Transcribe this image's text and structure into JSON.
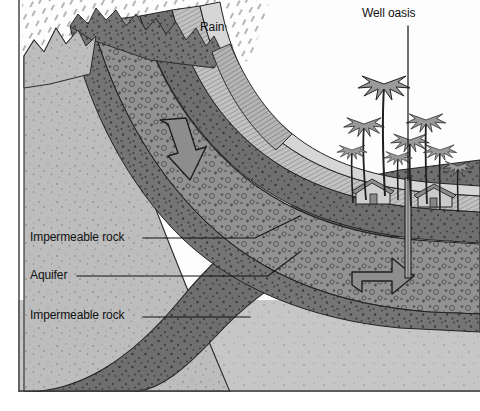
{
  "diagram": {
    "labels": {
      "rain": "Rain",
      "well_oasis": "Well oasis",
      "impermeable_rock_upper": "Impermeable rock",
      "aquifer": "Aquifer",
      "impermeable_rock_lower": "Impermeable rock"
    },
    "colors": {
      "sky": "#ffffff",
      "rain_hatch": "#7b7b7b",
      "surface_hatched": "#b9b9b9",
      "impermeable_dark": "#6e6e6e",
      "aquifer_mid": "#8e8e8e",
      "basement_light": "#bdbdbd",
      "outline": "#1a1a1a",
      "text": "#111111",
      "palm_fill": "#9a9a9a",
      "building_fill": "#c9c9c9"
    },
    "layers": [
      {
        "name": "rain",
        "pattern": "diagonal-dashes",
        "position": "top-left sky"
      },
      {
        "name": "surface-soil",
        "pattern": "fine-diagonal-hatch",
        "position": "topmost ground layer"
      },
      {
        "name": "impermeable-rock-upper",
        "pattern": "dense-dots",
        "position": "below surface"
      },
      {
        "name": "aquifer",
        "pattern": "circles-and-dots",
        "position": "middle water-bearing layer"
      },
      {
        "name": "impermeable-rock-lower",
        "pattern": "dense-dots",
        "position": "below aquifer"
      },
      {
        "name": "basement",
        "pattern": "sparse-speckle",
        "position": "bottom"
      }
    ],
    "flow_arrows": [
      {
        "name": "infiltration-arrow",
        "direction": "down-right",
        "layer": "aquifer",
        "region": "upper-left slope"
      },
      {
        "name": "well-upflow-arrow",
        "direction": "curving-up",
        "layer": "aquifer",
        "region": "beneath well"
      }
    ],
    "features": [
      {
        "name": "palm-grove",
        "count": 8,
        "position": "right plateau"
      },
      {
        "name": "oasis-buildings",
        "count": 2,
        "position": "right plateau"
      },
      {
        "name": "well-shaft",
        "orientation": "vertical",
        "position": "right, through layers into aquifer"
      }
    ]
  }
}
